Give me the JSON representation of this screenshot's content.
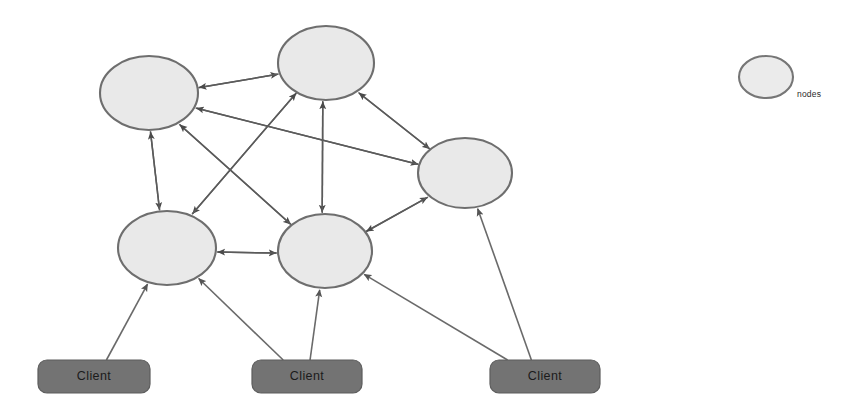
{
  "diagram": {
    "type": "node-link-diagram",
    "canvas": {
      "width": 856,
      "height": 412,
      "background": "#ffffff"
    },
    "style": {
      "node_fill": "#e9e9e9",
      "node_stroke": "#6e6e6e",
      "client_fill": "#737373",
      "client_stroke": "#5d5d5d",
      "edge_color": "#5b5b5b",
      "client_text_color": "#1b1b1b",
      "legend_text_color": "#2a2a2a"
    },
    "nodes": [
      {
        "id": "n-top-left",
        "label": "",
        "cx": 149,
        "cy": 93,
        "rx": 49,
        "ry": 37
      },
      {
        "id": "n-top-center",
        "label": "",
        "cx": 326,
        "cy": 63,
        "rx": 48,
        "ry": 37
      },
      {
        "id": "n-right",
        "label": "",
        "cx": 465,
        "cy": 173,
        "rx": 47,
        "ry": 35
      },
      {
        "id": "n-bottom-left",
        "label": "",
        "cx": 167,
        "cy": 248,
        "rx": 49,
        "ry": 37
      },
      {
        "id": "n-bottom-center",
        "label": "",
        "cx": 325,
        "cy": 251,
        "rx": 47,
        "ry": 37
      }
    ],
    "clients": [
      {
        "id": "client-1",
        "label": "Client",
        "x": 38,
        "y": 360,
        "width": 112,
        "height": 33,
        "radius": 9
      },
      {
        "id": "client-2",
        "label": "Client",
        "x": 252,
        "y": 360,
        "width": 110,
        "height": 33,
        "radius": 9
      },
      {
        "id": "client-3",
        "label": "Client",
        "x": 490,
        "y": 360,
        "width": 110,
        "height": 33,
        "radius": 9
      }
    ],
    "legend": {
      "label": "nodes",
      "ellipse": {
        "cx": 766,
        "cy": 77,
        "rx": 27,
        "ry": 21
      },
      "label_x": 797,
      "label_y": 95
    },
    "edges": [
      {
        "id": "e-tl-tc",
        "from": "n-top-left",
        "to": "n-top-center",
        "directed": true
      },
      {
        "id": "e-tc-tl",
        "from": "n-top-center",
        "to": "n-top-left",
        "directed": true
      },
      {
        "id": "e-tl-bl",
        "from": "n-top-left",
        "to": "n-bottom-left",
        "directed": true
      },
      {
        "id": "e-bl-tl",
        "from": "n-bottom-left",
        "to": "n-top-left",
        "directed": true
      },
      {
        "id": "e-tl-bc",
        "from": "n-top-left",
        "to": "n-bottom-center",
        "directed": true
      },
      {
        "id": "e-bc-tl",
        "from": "n-bottom-center",
        "to": "n-top-left",
        "directed": true
      },
      {
        "id": "e-tl-r",
        "from": "n-top-left",
        "to": "n-right",
        "directed": true
      },
      {
        "id": "e-r-tl",
        "from": "n-right",
        "to": "n-top-left",
        "directed": true
      },
      {
        "id": "e-tc-bc",
        "from": "n-top-center",
        "to": "n-bottom-center",
        "directed": true
      },
      {
        "id": "e-bc-tc",
        "from": "n-bottom-center",
        "to": "n-top-center",
        "directed": true
      },
      {
        "id": "e-tc-bl",
        "from": "n-top-center",
        "to": "n-bottom-left",
        "directed": true
      },
      {
        "id": "e-bl-tc",
        "from": "n-bottom-left",
        "to": "n-top-center",
        "directed": true
      },
      {
        "id": "e-tc-r",
        "from": "n-top-center",
        "to": "n-right",
        "directed": true
      },
      {
        "id": "e-r-tc",
        "from": "n-right",
        "to": "n-top-center",
        "directed": true
      },
      {
        "id": "e-bl-bc",
        "from": "n-bottom-left",
        "to": "n-bottom-center",
        "directed": true
      },
      {
        "id": "e-bc-bl",
        "from": "n-bottom-center",
        "to": "n-bottom-left",
        "directed": true
      },
      {
        "id": "e-bc-r",
        "from": "n-bottom-center",
        "to": "n-right",
        "directed": true
      },
      {
        "id": "e-r-bc",
        "from": "n-right",
        "to": "n-bottom-center",
        "directed": true
      }
    ],
    "client_edges": [
      {
        "id": "ce-1-bl",
        "from": "client-1",
        "to": "n-bottom-left",
        "directed": true
      },
      {
        "id": "ce-2-bl",
        "from": "client-2",
        "to": "n-bottom-left",
        "directed": true
      },
      {
        "id": "ce-2-bc",
        "from": "client-2",
        "to": "n-bottom-center",
        "directed": true
      },
      {
        "id": "ce-3-bc",
        "from": "client-3",
        "to": "n-bottom-center",
        "directed": true
      },
      {
        "id": "ce-3-r",
        "from": "client-3",
        "to": "n-right",
        "directed": true
      }
    ]
  }
}
